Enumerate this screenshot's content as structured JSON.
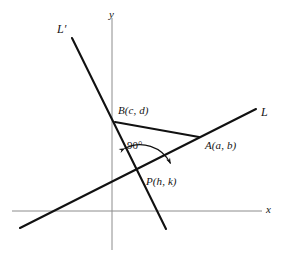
{
  "figure": {
    "background_color": "#ffffff",
    "width": 284,
    "height": 266
  },
  "axes": {
    "x_label": "x",
    "y_label": "y",
    "axis_color": "#8c8c8c",
    "origin": {
      "x": 112,
      "y": 211
    },
    "x_axis": {
      "x1": 12,
      "y1": 211,
      "x2": 262,
      "y2": 211
    },
    "y_axis": {
      "x1": 112,
      "y1": 18,
      "x2": 112,
      "y2": 250
    }
  },
  "lines": {
    "color": "#111111",
    "L": {
      "label": "L",
      "x1": 20,
      "y1": 228,
      "x2": 256,
      "y2": 109
    },
    "L_prime": {
      "label": "L′",
      "x1": 72,
      "y1": 38,
      "x2": 166,
      "y2": 229
    },
    "segment_BA": {
      "label": "BA",
      "x1": 115,
      "y1": 122,
      "x2": 199,
      "y2": 137
    }
  },
  "points": [
    {
      "name": "B",
      "label": "B(c, d)",
      "x": 115,
      "y": 122
    },
    {
      "name": "A",
      "label": "A(a, b)",
      "x": 199,
      "y": 137
    },
    {
      "name": "P",
      "label": "P(h, k)",
      "x": 141,
      "y": 175
    }
  ],
  "angle": {
    "label": "90°",
    "vertex": "P",
    "marker": "double-headed-arc"
  }
}
